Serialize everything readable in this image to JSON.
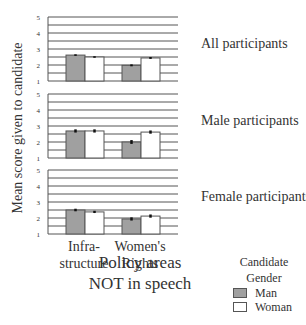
{
  "chart_data": [
    {
      "type": "bar",
      "title": "All participants",
      "categories": [
        "Infra-structure",
        "Women's Rights"
      ],
      "series": [
        {
          "name": "Man",
          "values": [
            2.62,
            1.98
          ],
          "errors": [
            0.05,
            0.06
          ],
          "color": "#a0a0a0"
        },
        {
          "name": "Woman",
          "values": [
            2.5,
            2.44
          ],
          "errors": [
            0.05,
            0.06
          ],
          "color": "#ffffff"
        }
      ],
      "ylim": [
        1,
        5
      ],
      "yticks": [
        1,
        2,
        3,
        4,
        5
      ],
      "grid": true
    },
    {
      "type": "bar",
      "title": "Male participants",
      "categories": [
        "Infra-structure",
        "Women's Rights"
      ],
      "series": [
        {
          "name": "Man",
          "values": [
            2.69,
            2.0
          ],
          "errors": [
            0.1,
            0.12
          ],
          "color": "#a0a0a0"
        },
        {
          "name": "Woman",
          "values": [
            2.69,
            2.62
          ],
          "errors": [
            0.1,
            0.1
          ],
          "color": "#ffffff"
        }
      ],
      "ylim": [
        1,
        5
      ],
      "yticks": [
        1,
        2,
        3,
        4,
        5
      ],
      "grid": true
    },
    {
      "type": "bar",
      "title": "Female participants",
      "categories": [
        "Infra-structure",
        "Women's Rights"
      ],
      "series": [
        {
          "name": "Man",
          "values": [
            2.5,
            1.94
          ],
          "errors": [
            0.08,
            0.1
          ],
          "color": "#a0a0a0"
        },
        {
          "name": "Woman",
          "values": [
            2.38,
            2.12
          ],
          "errors": [
            0.07,
            0.1
          ],
          "color": "#ffffff"
        }
      ],
      "ylim": [
        1,
        5
      ],
      "yticks": [
        1,
        2,
        3,
        4,
        5
      ],
      "grid": true
    }
  ],
  "labels": {
    "ylabel": "Mean score given to candidate",
    "panels": [
      "All participants",
      "Male participants",
      "Female participants"
    ],
    "categories": [
      {
        "line1": "Infra-",
        "line2": "structure"
      },
      {
        "line1": "Women's",
        "line2": "Rights"
      }
    ],
    "xtitle_line1": "Policy areas",
    "xtitle_line2": "NOT in speech",
    "legend_title_line1": "Candidate",
    "legend_title_line2": "Gender",
    "legend_man": "Man",
    "legend_woman": "Woman",
    "ytick_labels": [
      "1",
      "2",
      "3",
      "4",
      "5"
    ]
  },
  "colors": {
    "man": "#a0a0a0",
    "woman": "#ffffff",
    "grid": "#555555"
  }
}
